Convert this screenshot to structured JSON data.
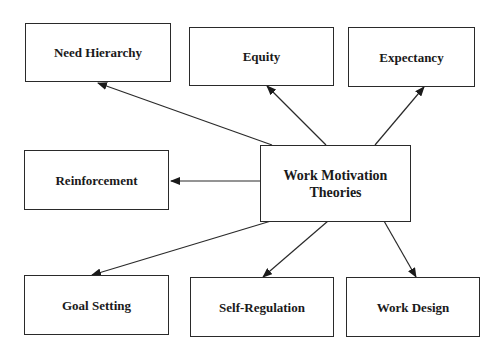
{
  "diagram": {
    "center": {
      "label_line1": "Work Motivation",
      "label_line2": "Theories"
    },
    "nodes": [
      {
        "id": "need-hierarchy",
        "label": "Need Hierarchy"
      },
      {
        "id": "equity",
        "label": "Equity"
      },
      {
        "id": "expectancy",
        "label": "Expectancy"
      },
      {
        "id": "reinforcement",
        "label": "Reinforcement"
      },
      {
        "id": "goal-setting",
        "label": "Goal Setting"
      },
      {
        "id": "self-regulation",
        "label": "Self-Regulation"
      },
      {
        "id": "work-design",
        "label": "Work Design"
      }
    ],
    "edges": [
      {
        "from": "center",
        "to": "need-hierarchy"
      },
      {
        "from": "center",
        "to": "equity"
      },
      {
        "from": "center",
        "to": "expectancy"
      },
      {
        "from": "center",
        "to": "reinforcement"
      },
      {
        "from": "center",
        "to": "goal-setting"
      },
      {
        "from": "center",
        "to": "self-regulation"
      },
      {
        "from": "center",
        "to": "work-design"
      }
    ],
    "colors": {
      "line": "#2a2a2a",
      "text": "#1a1a1a",
      "background": "#ffffff"
    }
  }
}
